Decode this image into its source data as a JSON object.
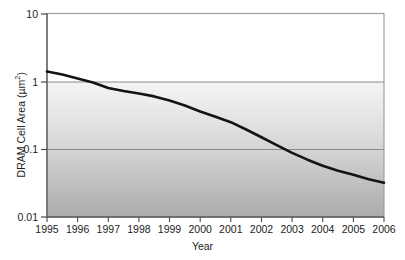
{
  "chart_data": {
    "type": "line",
    "title": "",
    "xlabel": "Year",
    "ylabel": "DRAM Cell Area (µm²)",
    "ylabel_base": "DRAM Cell Area (µm",
    "ylabel_sup": "2",
    "ylabel_tail": ")",
    "yscale": "log",
    "ylim": [
      0.01,
      10
    ],
    "xlim": [
      1995,
      2006
    ],
    "grid": "horizontal-major",
    "legend": "none",
    "ytick_labels": [
      "10",
      "1",
      "0.1",
      "0.01"
    ],
    "ytick_values": [
      10,
      1,
      0.1,
      0.01
    ],
    "xtick_labels": [
      "1995",
      "1996",
      "1997",
      "1998",
      "1999",
      "2000",
      "2001",
      "2002",
      "2003",
      "2004",
      "2005",
      "2006"
    ],
    "xtick_values": [
      1995,
      1996,
      1997,
      1998,
      1999,
      2000,
      2001,
      2002,
      2003,
      2004,
      2005,
      2006
    ],
    "series": [
      {
        "name": "DRAM cell area",
        "x": [
          1995,
          1995.5,
          1996,
          1996.5,
          1997,
          1997.5,
          1998,
          1998.5,
          1999,
          1999.5,
          2000,
          2000.5,
          2001,
          2001.5,
          2002,
          2002.5,
          2003,
          2003.5,
          2004,
          2004.5,
          2005,
          2005.5,
          2006
        ],
        "y": [
          1.4,
          1.26,
          1.1,
          0.96,
          0.8,
          0.72,
          0.66,
          0.6,
          0.52,
          0.44,
          0.36,
          0.3,
          0.25,
          0.195,
          0.15,
          0.115,
          0.088,
          0.07,
          0.057,
          0.048,
          0.042,
          0.036,
          0.032
        ]
      }
    ],
    "colors": {
      "line": "#141414",
      "grid": "#8c8c8c",
      "frame": "#9a9a9a",
      "plot_top_fill": "#ffffff",
      "plot_gradient_top": "#f2f2f2",
      "plot_gradient_bottom": "#aeaeae",
      "text": "#1c1c1c"
    }
  }
}
